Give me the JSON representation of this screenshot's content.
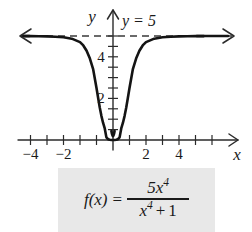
{
  "figure": {
    "kind": "function-graph",
    "axes": {
      "x_axis_label": "x",
      "y_axis_label": "y",
      "x_ticks_labeled": [
        "−4",
        "−2",
        "2",
        "4"
      ],
      "y_ticks_labeled": [
        "2",
        "4"
      ]
    },
    "asymptote": {
      "label": "y = 5",
      "value": 5,
      "style": "dashed"
    },
    "formula": {
      "lhs": "f(x)",
      "equals": "=",
      "numerator_coefficient": "5",
      "numerator_variable": "x",
      "numerator_exponent": "4",
      "denominator_variable": "x",
      "denominator_exponent": "4",
      "denominator_plus": "+",
      "denominator_constant": "1",
      "plain": "f(x) = 5x^4 / (x^4 + 1)"
    },
    "colors": {
      "curve": "#141414",
      "axis": "#2b2b2b",
      "asymptote": "#3a3a3a",
      "caption_background": "#e8e8e8",
      "page_background": "#ffffff"
    }
  },
  "chart_data": {
    "type": "line",
    "title": "",
    "xlabel": "x",
    "ylabel": "y",
    "xlim": [
      -5.6,
      5.6
    ],
    "ylim": [
      -0.6,
      6.2
    ],
    "grid": false,
    "legend": "none",
    "annotations": [
      {
        "text": "y = 5",
        "x": 0.6,
        "y": 5.9,
        "kind": "asymptote-label"
      }
    ],
    "xticks": [
      -5,
      -4.5,
      -4,
      -3.5,
      -3,
      -2.5,
      -2,
      -1.5,
      -1,
      -0.5,
      0.5,
      1,
      1.5,
      2,
      2.5,
      3,
      3.5,
      4,
      4.5,
      5
    ],
    "xtick_labels": {
      "-4": "−4",
      "-2": "−2",
      "2": "2",
      "4": "4"
    },
    "yticks": [
      0.5,
      1,
      1.5,
      2,
      2.5,
      3,
      3.5,
      4,
      4.5,
      5
    ],
    "ytick_labels": {
      "2": "2",
      "4": "4"
    },
    "series": [
      {
        "name": "f(x) = 5x^4/(x^4 + 1)",
        "expression": "5*x^4/(x^4+1)",
        "style": "solid",
        "x": [
          -5.5,
          -5,
          -4.5,
          -4,
          -3.5,
          -3,
          -2.5,
          -2,
          -1.8,
          -1.6,
          -1.4,
          -1.2,
          -1,
          -0.9,
          -0.8,
          -0.7,
          -0.6,
          -0.5,
          -0.4,
          -0.3,
          -0.2,
          -0.1,
          0,
          0.1,
          0.2,
          0.3,
          0.4,
          0.5,
          0.6,
          0.7,
          0.8,
          0.9,
          1,
          1.2,
          1.4,
          1.6,
          1.8,
          2,
          2.5,
          3,
          3.5,
          4,
          4.5,
          5,
          5.5
        ],
        "y": [
          4.995,
          4.992,
          4.988,
          4.981,
          4.967,
          4.939,
          4.872,
          4.706,
          4.545,
          4.289,
          3.913,
          3.392,
          2.5,
          2.021,
          1.555,
          1.148,
          0.818,
          0.556,
          0.126,
          0.04,
          0.008,
          0.0005,
          0,
          0.0005,
          0.008,
          0.04,
          0.126,
          0.556,
          0.818,
          1.148,
          1.555,
          2.021,
          2.5,
          3.392,
          3.913,
          4.289,
          4.545,
          4.706,
          4.872,
          4.939,
          4.967,
          4.981,
          4.988,
          4.992,
          4.995
        ]
      },
      {
        "name": "horizontal asymptote y = 5",
        "style": "dashed",
        "x": [
          -5.6,
          5.6
        ],
        "y": [
          5,
          5
        ]
      }
    ]
  }
}
